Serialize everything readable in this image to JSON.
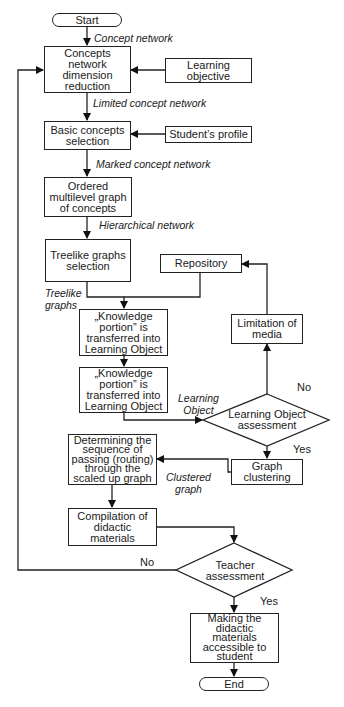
{
  "nodes": {
    "start": "Start",
    "concepts_reduction": "Concepts\nnetwork\ndimension\nreduction",
    "learning_objective": "Learning\nobjective",
    "basic_concepts": "Basic concepts\nselection",
    "students_profile": "Student’s profile",
    "ordered_graph": "Ordered\nmultilevel graph\nof concepts",
    "treelike_selection": "Treelike graphs\nselection",
    "repository": "Repository",
    "knowledge_portion_1": "„Knowledge\nportion” is\ntransferred into\nLearning Object",
    "limitation_media": "Limitation of\nmedia",
    "knowledge_portion_2": "„Knowledge\nportion” is\ntransferred into\nLearning Object",
    "lo_assessment": "Learning Object\nassessment",
    "determining_sequence": "Determining the\nsequence of\npassing (routing)\nthrough the\nscaled up graph",
    "graph_clustering": "Graph\nclustering",
    "compilation": "Compilation of\ndidactic\nmaterials",
    "teacher_assessment": "Teacher\nassessment",
    "making_accessible": "Making the\ndidactic\nmaterials\naccessible to\nstudent",
    "end": "End"
  },
  "edge_labels": {
    "concept_network": "Concept network",
    "limited_concept_network": "Limited concept network",
    "marked_concept_network": "Marked concept network",
    "hierarchical_network": "Hierarchical network",
    "treelike_graphs": "Treelike\ngraphs",
    "learning_object": "Learning\nObject",
    "clustered_graph": "Clustered\ngraph"
  },
  "branches": {
    "lo_no": "No",
    "lo_yes": "Yes",
    "teacher_no": "No",
    "teacher_yes": "Yes"
  }
}
